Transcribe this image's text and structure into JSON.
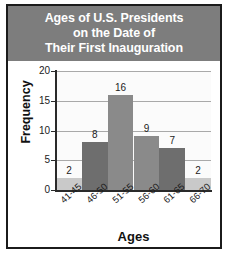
{
  "figure": {
    "title_lines": [
      "Ages of U.S. Presidents",
      "on the Date of",
      "Their First Inauguration"
    ],
    "title_bg": "#7d7d7d",
    "title_color": "#ffffff",
    "border_color": "#1b1b1b",
    "plot_bg": "#fbfbfb",
    "gridline_color": "#a9a9a9",
    "axis_color": "#2a2a2a"
  },
  "chart_data": {
    "type": "bar",
    "title": "Ages of U.S. Presidents on the Date of Their First Inauguration",
    "categories": [
      "41-45",
      "46-50",
      "51-55",
      "56-60",
      "61-65",
      "66-70"
    ],
    "values": [
      2,
      8,
      16,
      9,
      7,
      2
    ],
    "bar_colors": [
      "#c9c9c9",
      "#6e6e6e",
      "#8a8a8a",
      "#8a8a8a",
      "#6e6e6e",
      "#c9c9c9"
    ],
    "xlabel": "Ages",
    "ylabel": "Frequency",
    "ylim": [
      0,
      20
    ],
    "yticks": [
      0,
      5,
      10,
      15,
      20
    ],
    "ytick_labels": [
      "0",
      "5",
      "10",
      "15",
      "20"
    ],
    "grid": true,
    "legend": false,
    "data_labels": [
      "2",
      "8",
      "16",
      "9",
      "7",
      "2"
    ]
  }
}
